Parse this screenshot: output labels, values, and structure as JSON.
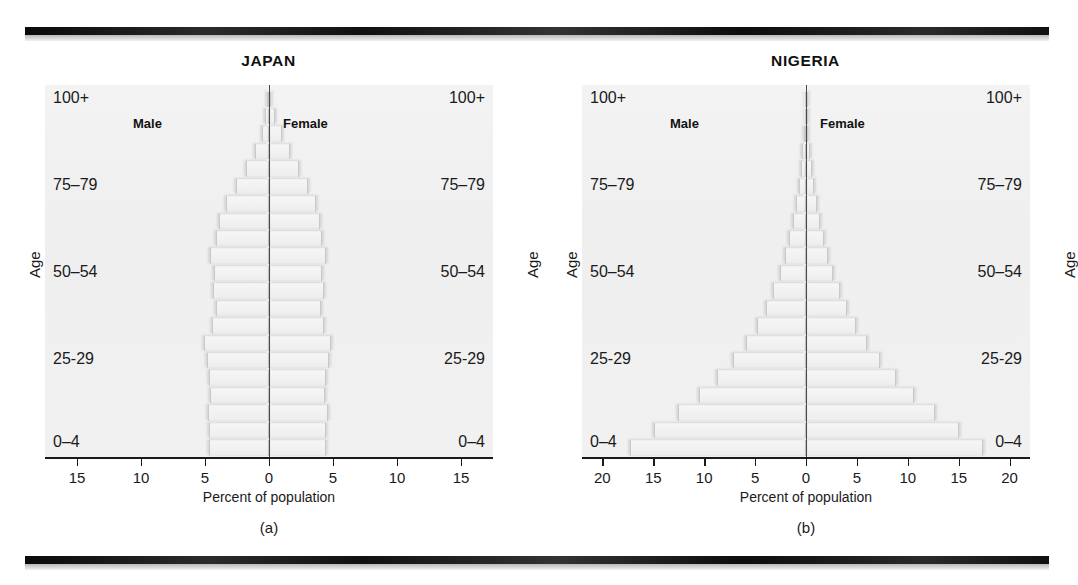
{
  "figure": {
    "background_color": "#ffffff",
    "rule_color": "#141414",
    "panel_bg_color": "#f1f1f1",
    "bar_fill_color": "#efefef",
    "axis_color": "#1a1a1a"
  },
  "panels": [
    {
      "title": "JAPAN",
      "subcaption": "(a)",
      "axis_title": "Percent of population",
      "age_axis_label_left": "Age",
      "age_axis_label_right": "Age",
      "male_legend": "Male",
      "female_legend": "Female",
      "age_tick_labels": [
        "100+",
        "75–79",
        "50–54",
        "25-29",
        "0–4"
      ],
      "x_tick_labels": [
        "15",
        "10",
        "5",
        "0",
        "5",
        "10",
        "15"
      ]
    },
    {
      "title": "NIGERIA",
      "subcaption": "(b)",
      "axis_title": "Percent of population",
      "age_axis_label_left": "Age",
      "age_axis_label_right": "Age",
      "male_legend": "Male",
      "female_legend": "Female",
      "age_tick_labels": [
        "100+",
        "75–79",
        "50–54",
        "25-29",
        "0–4"
      ],
      "x_tick_labels": [
        "20",
        "15",
        "10",
        "5",
        "0",
        "5",
        "10",
        "15",
        "20"
      ]
    }
  ],
  "chart_data": [
    {
      "type": "bar",
      "title": "JAPAN",
      "subtitle": "(a)",
      "orientation": "horizontal",
      "layout": "population-pyramid",
      "xlabel": "Percent of population",
      "ylabel": "Age",
      "xlim": [
        -17.5,
        17.5
      ],
      "x_ticks": [
        -15,
        -10,
        -5,
        0,
        5,
        10,
        15
      ],
      "x_tick_labels": [
        "15",
        "10",
        "5",
        "0",
        "5",
        "10",
        "15"
      ],
      "grid": false,
      "legend": [
        "Male",
        "Female"
      ],
      "legend_position": "inside-top",
      "categories": [
        "0–4",
        "5–9",
        "10–14",
        "15–19",
        "20–24",
        "25-29",
        "30–34",
        "35–39",
        "40–44",
        "45–49",
        "50–54",
        "55–59",
        "60–64",
        "65–69",
        "70–74",
        "75–79",
        "80–84",
        "85–89",
        "90–94",
        "95–99",
        "100+"
      ],
      "series": [
        {
          "name": "Male",
          "side": "left",
          "values": [
            4.6,
            4.6,
            4.7,
            4.5,
            4.6,
            4.8,
            5.0,
            4.4,
            4.1,
            4.3,
            4.2,
            4.5,
            4.1,
            3.8,
            3.3,
            2.5,
            1.7,
            1.0,
            0.5,
            0.2,
            0.05
          ]
        },
        {
          "name": "Female",
          "side": "right",
          "values": [
            4.4,
            4.4,
            4.5,
            4.3,
            4.4,
            4.6,
            4.8,
            4.2,
            4.0,
            4.2,
            4.1,
            4.4,
            4.1,
            3.9,
            3.6,
            3.0,
            2.3,
            1.6,
            0.9,
            0.4,
            0.1
          ]
        }
      ]
    },
    {
      "type": "bar",
      "title": "NIGERIA",
      "subtitle": "(b)",
      "orientation": "horizontal",
      "layout": "population-pyramid",
      "xlabel": "Percent of population",
      "ylabel": "Age",
      "xlim": [
        -22,
        22
      ],
      "x_ticks": [
        -20,
        -15,
        -10,
        -5,
        0,
        5,
        10,
        15,
        20
      ],
      "x_tick_labels": [
        "20",
        "15",
        "10",
        "5",
        "0",
        "5",
        "10",
        "15",
        "20"
      ],
      "grid": false,
      "legend": [
        "Male",
        "Female"
      ],
      "legend_position": "inside-top",
      "categories": [
        "0–4",
        "5–9",
        "10–14",
        "15–19",
        "20–24",
        "25-29",
        "30–34",
        "35–39",
        "40–44",
        "45–49",
        "50–54",
        "55–59",
        "60–64",
        "65–69",
        "70–74",
        "75–79",
        "80–84",
        "85–89",
        "90–94",
        "95–99",
        "100+"
      ],
      "series": [
        {
          "name": "Male",
          "side": "left",
          "values": [
            17.2,
            14.8,
            12.5,
            10.4,
            8.6,
            7.1,
            5.8,
            4.7,
            3.8,
            3.1,
            2.5,
            2.0,
            1.6,
            1.2,
            0.9,
            0.6,
            0.4,
            0.25,
            0.12,
            0.05,
            0.02
          ]
        },
        {
          "name": "Female",
          "side": "right",
          "values": [
            17.3,
            14.9,
            12.6,
            10.5,
            8.7,
            7.2,
            5.9,
            4.8,
            3.9,
            3.2,
            2.6,
            2.1,
            1.7,
            1.3,
            1.0,
            0.7,
            0.45,
            0.28,
            0.14,
            0.06,
            0.02
          ]
        }
      ]
    }
  ]
}
